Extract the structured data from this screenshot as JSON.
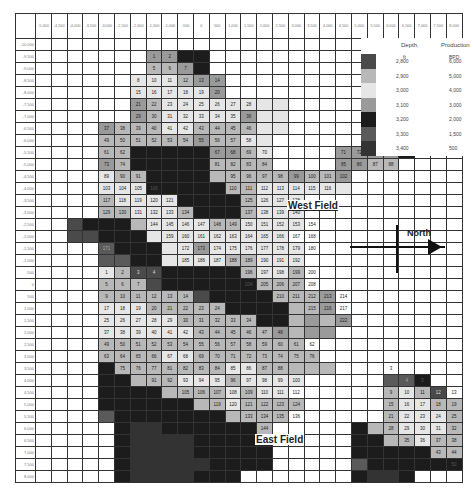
{
  "map": {
    "x_labels": [
      "-5,000",
      "-4,500",
      "-4,000",
      "-3,500",
      "-3,000",
      "-2,500",
      "-2,000",
      "-1,500",
      "-1,000",
      "-500",
      "0",
      "500",
      "1,000",
      "1,500",
      "2,000",
      "2,500",
      "3,000",
      "3,500",
      "4,000",
      "4,500",
      "5,000",
      "5,500",
      "6,000",
      "6,500",
      "7,000",
      "7,500",
      "8,000"
    ],
    "y_labels": [
      "-10,000",
      "-9,500",
      "-9,000",
      "-8,500",
      "-8,000",
      "-7,500",
      "-7,000",
      "-6,500",
      "-6,000",
      "-5,500",
      "-5,000",
      "-4,500",
      "-4,000",
      "-3,500",
      "-3,000",
      "-2,500",
      "-2,000",
      "-1,500",
      "-1,000",
      "-500",
      "0",
      "500",
      "1,000",
      "1,500",
      "2,000",
      "2,500",
      "3,000",
      "3,500",
      "4,000",
      "4,500",
      "5,000",
      "5,500",
      "6,000",
      "6,500",
      "7,000",
      "7,500",
      "8,000"
    ],
    "shade_rows": [
      "000000000000000000000000000",
      "0000000ddee000000000000000",
      "0000000bbde0000000000000000",
      "000000cccbdd000000000000000",
      "000000cccccd000000000000000",
      "000000dbcccccccc00000000000",
      "000000dbcccccdcc00000000000",
      "0000dbbbccbbbbcc00000ee0000",
      "0000bbbbbbdbbcc000000ae0000",
      "0000bbeeeeeddbc0000dddde000",
      "0000dbeeeeebbbb0000ddbb0000",
      "0000cbbeeeebbbbbdbbd0000000",
      "0000ccceeeeebbcccccc0000000",
      "0000bcccceeeebccc0000000000",
      "0000bbcccbeeebccc0000000000",
      "00aeeebccccbbcccc0000000000",
      "00aaeeeccccccccc00000000000",
      "0000feeeccdcccccc0000000000",
      "0000ffeeccccbbccc0000000000",
      "0000cbaaeeeeebccb0000000000",
      "0000bbbaeeeeeebbb0000000000",
      "0000bbbbbbaeeeebbbd00000000",
      "0000cccbbbbbeeeebbd00000000",
      "0000cccccbbbbbeebdbd000000000",
      "0000ccccccbbbbbdbdd00000000",
      "0000bbbbbbbbbbbbb0000000000",
      "0000bbbbccbbbbbbbb000000000",
      "0000ebbbbbbbccbbbbb00000000",
      "0000eebbbcccbcccc00000ffe00",
      "0000eeeebbbbcbcc000000bcba00",
      "0000eeeeeebbcbbbb00000bccbb00",
      "0000feeeeeeebbbb000000bcccbb",
      "00000eggeeeeeeb00000ebbcccbb0",
      "00000eggggeeeee00000eebbcbb0",
      "00000eggggeeeee00000eeeeebb0",
      "00000egggggeeee00000feeeeee0",
      "00000eggggeee0000000egge0000"
    ],
    "numbers": [
      [
        1,
        7,
        1
      ],
      [
        1,
        8,
        2
      ],
      [
        2,
        7,
        5
      ],
      [
        2,
        8,
        6
      ],
      [
        2,
        9,
        7
      ],
      [
        3,
        6,
        8
      ],
      [
        3,
        7,
        10
      ],
      [
        3,
        8,
        11
      ],
      [
        3,
        9,
        12
      ],
      [
        3,
        10,
        13
      ],
      [
        3,
        11,
        14
      ],
      [
        4,
        6,
        15
      ],
      [
        4,
        7,
        16
      ],
      [
        4,
        8,
        17
      ],
      [
        4,
        9,
        18
      ],
      [
        4,
        10,
        19
      ],
      [
        4,
        11,
        20
      ],
      [
        5,
        6,
        21
      ],
      [
        5,
        7,
        22
      ],
      [
        5,
        8,
        23
      ],
      [
        5,
        9,
        24
      ],
      [
        5,
        10,
        25
      ],
      [
        5,
        11,
        26
      ],
      [
        5,
        12,
        27
      ],
      [
        5,
        13,
        28
      ],
      [
        6,
        6,
        29
      ],
      [
        6,
        7,
        30
      ],
      [
        6,
        8,
        31
      ],
      [
        6,
        9,
        32
      ],
      [
        6,
        10,
        33
      ],
      [
        6,
        11,
        34
      ],
      [
        6,
        12,
        35
      ],
      [
        6,
        13,
        36
      ],
      [
        7,
        4,
        37
      ],
      [
        7,
        5,
        38
      ],
      [
        7,
        6,
        39
      ],
      [
        7,
        7,
        40
      ],
      [
        7,
        8,
        41
      ],
      [
        7,
        9,
        42
      ],
      [
        7,
        10,
        43
      ],
      [
        7,
        11,
        44
      ],
      [
        7,
        12,
        45
      ],
      [
        7,
        13,
        46
      ],
      [
        8,
        4,
        49
      ],
      [
        8,
        5,
        50
      ],
      [
        8,
        6,
        51
      ],
      [
        8,
        7,
        52
      ],
      [
        8,
        8,
        53
      ],
      [
        8,
        9,
        54
      ],
      [
        8,
        10,
        55
      ],
      [
        8,
        11,
        56
      ],
      [
        8,
        12,
        57
      ],
      [
        8,
        13,
        58
      ],
      [
        9,
        4,
        61
      ],
      [
        9,
        5,
        62
      ],
      [
        9,
        11,
        67
      ],
      [
        9,
        12,
        68
      ],
      [
        9,
        13,
        69
      ],
      [
        9,
        14,
        70
      ],
      [
        9,
        19,
        71
      ],
      [
        9,
        20,
        72
      ],
      [
        9,
        21,
        73
      ],
      [
        10,
        4,
        73
      ],
      [
        10,
        5,
        74
      ],
      [
        10,
        11,
        81
      ],
      [
        10,
        12,
        82
      ],
      [
        10,
        13,
        83
      ],
      [
        10,
        14,
        84
      ],
      [
        10,
        19,
        85
      ],
      [
        10,
        20,
        86
      ],
      [
        10,
        21,
        87
      ],
      [
        10,
        22,
        88
      ],
      [
        11,
        4,
        89
      ],
      [
        11,
        5,
        90
      ],
      [
        11,
        6,
        91
      ],
      [
        11,
        12,
        95
      ],
      [
        11,
        13,
        96
      ],
      [
        11,
        14,
        97
      ],
      [
        11,
        15,
        98
      ],
      [
        11,
        16,
        99
      ],
      [
        11,
        17,
        100
      ],
      [
        11,
        18,
        101
      ],
      [
        11,
        19,
        102
      ],
      [
        12,
        4,
        103
      ],
      [
        12,
        5,
        104
      ],
      [
        12,
        6,
        105
      ],
      [
        12,
        7,
        106
      ],
      [
        12,
        12,
        110
      ],
      [
        12,
        13,
        111
      ],
      [
        12,
        14,
        112
      ],
      [
        12,
        15,
        113
      ],
      [
        12,
        16,
        114
      ],
      [
        12,
        17,
        115
      ],
      [
        12,
        18,
        116
      ],
      [
        13,
        4,
        117
      ],
      [
        13,
        5,
        118
      ],
      [
        13,
        6,
        119
      ],
      [
        13,
        7,
        120
      ],
      [
        13,
        8,
        121
      ],
      [
        13,
        13,
        125
      ],
      [
        13,
        14,
        126
      ],
      [
        13,
        15,
        127
      ],
      [
        13,
        16,
        128
      ],
      [
        14,
        4,
        129
      ],
      [
        14,
        5,
        130
      ],
      [
        14,
        6,
        131
      ],
      [
        14,
        7,
        132
      ],
      [
        14,
        8,
        133
      ],
      [
        14,
        9,
        134
      ],
      [
        14,
        13,
        137
      ],
      [
        14,
        14,
        138
      ],
      [
        14,
        15,
        139
      ],
      [
        14,
        16,
        140
      ],
      [
        15,
        7,
        144
      ],
      [
        15,
        8,
        145
      ],
      [
        15,
        9,
        146
      ],
      [
        15,
        10,
        147
      ],
      [
        15,
        11,
        148
      ],
      [
        15,
        12,
        149
      ],
      [
        15,
        13,
        150
      ],
      [
        15,
        14,
        151
      ],
      [
        15,
        15,
        152
      ],
      [
        15,
        16,
        153
      ],
      [
        15,
        17,
        154
      ],
      [
        16,
        8,
        159
      ],
      [
        16,
        9,
        160
      ],
      [
        16,
        10,
        161
      ],
      [
        16,
        11,
        162
      ],
      [
        16,
        12,
        163
      ],
      [
        16,
        13,
        164
      ],
      [
        16,
        14,
        165
      ],
      [
        16,
        15,
        166
      ],
      [
        16,
        16,
        167
      ],
      [
        16,
        17,
        168
      ],
      [
        17,
        4,
        171
      ],
      [
        17,
        9,
        172
      ],
      [
        17,
        10,
        173
      ],
      [
        17,
        11,
        174
      ],
      [
        17,
        12,
        175
      ],
      [
        17,
        13,
        176
      ],
      [
        17,
        14,
        177
      ],
      [
        17,
        15,
        178
      ],
      [
        17,
        16,
        179
      ],
      [
        17,
        17,
        180
      ],
      [
        18,
        9,
        185
      ],
      [
        18,
        10,
        186
      ],
      [
        18,
        11,
        187
      ],
      [
        18,
        12,
        188
      ],
      [
        18,
        13,
        189
      ],
      [
        18,
        14,
        190
      ],
      [
        18,
        15,
        191
      ],
      [
        18,
        16,
        192
      ],
      [
        19,
        4,
        1
      ],
      [
        19,
        5,
        2
      ],
      [
        19,
        6,
        3
      ],
      [
        19,
        7,
        4
      ],
      [
        19,
        13,
        196
      ],
      [
        19,
        14,
        197
      ],
      [
        19,
        15,
        198
      ],
      [
        19,
        16,
        199
      ],
      [
        19,
        17,
        200
      ],
      [
        20,
        4,
        5
      ],
      [
        20,
        5,
        6
      ],
      [
        20,
        6,
        7
      ],
      [
        20,
        13,
        204
      ],
      [
        20,
        14,
        205
      ],
      [
        20,
        15,
        206
      ],
      [
        20,
        16,
        207
      ],
      [
        20,
        17,
        208
      ],
      [
        21,
        4,
        9
      ],
      [
        21,
        5,
        10
      ],
      [
        21,
        6,
        11
      ],
      [
        21,
        7,
        12
      ],
      [
        21,
        8,
        13
      ],
      [
        21,
        9,
        14
      ],
      [
        21,
        15,
        210
      ],
      [
        21,
        16,
        211
      ],
      [
        21,
        17,
        212
      ],
      [
        21,
        18,
        213
      ],
      [
        21,
        19,
        214
      ],
      [
        22,
        4,
        17
      ],
      [
        22,
        5,
        18
      ],
      [
        22,
        6,
        19
      ],
      [
        22,
        7,
        20
      ],
      [
        22,
        8,
        21
      ],
      [
        22,
        9,
        22
      ],
      [
        22,
        10,
        23
      ],
      [
        22,
        11,
        24
      ],
      [
        22,
        17,
        215
      ],
      [
        22,
        18,
        216
      ],
      [
        22,
        19,
        217
      ],
      [
        23,
        4,
        25
      ],
      [
        23,
        5,
        26
      ],
      [
        23,
        6,
        27
      ],
      [
        23,
        7,
        28
      ],
      [
        23,
        8,
        29
      ],
      [
        23,
        9,
        30
      ],
      [
        23,
        10,
        31
      ],
      [
        23,
        11,
        32
      ],
      [
        23,
        12,
        33
      ],
      [
        23,
        13,
        34
      ],
      [
        23,
        19,
        222
      ],
      [
        24,
        4,
        37
      ],
      [
        24,
        5,
        38
      ],
      [
        24,
        6,
        39
      ],
      [
        24,
        7,
        40
      ],
      [
        24,
        8,
        41
      ],
      [
        24,
        9,
        42
      ],
      [
        24,
        10,
        43
      ],
      [
        24,
        11,
        44
      ],
      [
        24,
        12,
        45
      ],
      [
        24,
        13,
        46
      ],
      [
        24,
        14,
        47
      ],
      [
        24,
        15,
        48
      ],
      [
        25,
        4,
        49
      ],
      [
        25,
        5,
        50
      ],
      [
        25,
        6,
        51
      ],
      [
        25,
        7,
        52
      ],
      [
        25,
        8,
        53
      ],
      [
        25,
        9,
        54
      ],
      [
        25,
        10,
        55
      ],
      [
        25,
        11,
        56
      ],
      [
        25,
        12,
        57
      ],
      [
        25,
        13,
        58
      ],
      [
        25,
        14,
        59
      ],
      [
        25,
        15,
        60
      ],
      [
        25,
        16,
        61
      ],
      [
        25,
        17,
        62
      ],
      [
        26,
        4,
        63
      ],
      [
        26,
        5,
        64
      ],
      [
        26,
        6,
        65
      ],
      [
        26,
        7,
        66
      ],
      [
        26,
        8,
        67
      ],
      [
        26,
        9,
        68
      ],
      [
        26,
        10,
        69
      ],
      [
        26,
        11,
        70
      ],
      [
        26,
        12,
        71
      ],
      [
        26,
        13,
        72
      ],
      [
        26,
        14,
        73
      ],
      [
        26,
        15,
        74
      ],
      [
        26,
        16,
        75
      ],
      [
        26,
        17,
        76
      ],
      [
        27,
        5,
        75
      ],
      [
        27,
        6,
        76
      ],
      [
        27,
        7,
        77
      ],
      [
        27,
        8,
        81
      ],
      [
        27,
        9,
        82
      ],
      [
        27,
        10,
        83
      ],
      [
        27,
        11,
        84
      ],
      [
        27,
        12,
        85
      ],
      [
        27,
        13,
        86
      ],
      [
        27,
        14,
        87
      ],
      [
        27,
        15,
        88
      ],
      [
        27,
        22,
        3
      ],
      [
        28,
        7,
        91
      ],
      [
        28,
        8,
        92
      ],
      [
        28,
        9,
        93
      ],
      [
        28,
        10,
        94
      ],
      [
        28,
        11,
        95
      ],
      [
        28,
        12,
        96
      ],
      [
        28,
        13,
        97
      ],
      [
        28,
        14,
        98
      ],
      [
        28,
        15,
        99
      ],
      [
        28,
        16,
        100
      ],
      [
        28,
        23,
        4
      ],
      [
        28,
        24,
        5
      ],
      [
        29,
        9,
        105
      ],
      [
        29,
        10,
        106
      ],
      [
        29,
        11,
        107
      ],
      [
        29,
        12,
        108
      ],
      [
        29,
        13,
        109
      ],
      [
        29,
        14,
        110
      ],
      [
        29,
        15,
        111
      ],
      [
        29,
        16,
        112
      ],
      [
        29,
        22,
        9
      ],
      [
        29,
        23,
        10
      ],
      [
        29,
        24,
        11
      ],
      [
        29,
        25,
        12
      ],
      [
        29,
        26,
        13
      ],
      [
        30,
        11,
        119
      ],
      [
        30,
        12,
        120
      ],
      [
        30,
        13,
        121
      ],
      [
        30,
        14,
        122
      ],
      [
        30,
        15,
        123
      ],
      [
        30,
        16,
        124
      ],
      [
        30,
        22,
        15
      ],
      [
        30,
        23,
        16
      ],
      [
        30,
        24,
        17
      ],
      [
        30,
        25,
        18
      ],
      [
        30,
        26,
        19
      ],
      [
        31,
        13,
        133
      ],
      [
        31,
        14,
        134
      ],
      [
        31,
        15,
        135
      ],
      [
        31,
        16,
        136
      ],
      [
        31,
        22,
        21
      ],
      [
        31,
        23,
        22
      ],
      [
        31,
        24,
        23
      ],
      [
        31,
        25,
        24
      ],
      [
        31,
        26,
        25
      ],
      [
        32,
        14,
        144
      ],
      [
        32,
        22,
        28
      ],
      [
        32,
        23,
        29
      ],
      [
        32,
        24,
        30
      ],
      [
        32,
        25,
        31
      ],
      [
        32,
        26,
        32
      ],
      [
        33,
        23,
        35
      ],
      [
        33,
        24,
        36
      ],
      [
        33,
        25,
        37
      ],
      [
        33,
        26,
        38
      ],
      [
        34,
        25,
        43
      ],
      [
        34,
        26,
        44
      ],
      [
        35,
        26,
        50
      ]
    ]
  },
  "legend": {
    "depth_title": "Depth,",
    "depth_unit": "ft",
    "production_title": "Production",
    "production_unit": "BPD",
    "entries": [
      {
        "depth": "2,800",
        "production": "6,000",
        "shade": "sa"
      },
      {
        "depth": "2,900",
        "production": "5,000",
        "shade": "sb"
      },
      {
        "depth": "3,000",
        "production": "4,000",
        "shade": "sc"
      },
      {
        "depth": "3,100",
        "production": "3,000",
        "shade": "sd"
      },
      {
        "depth": "3,200",
        "production": "2,000",
        "shade": "se"
      },
      {
        "depth": "3,300",
        "production": "1,500",
        "shade": "sf"
      },
      {
        "depth": "3,400",
        "production": "500",
        "shade": "sg"
      }
    ]
  },
  "labels": {
    "west_field": "West Field",
    "east_field": "East Field",
    "north": "North"
  }
}
